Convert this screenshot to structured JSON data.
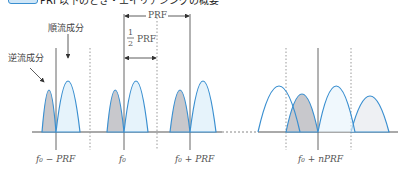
{
  "header": {
    "title_partial": "PRF以下のとき・エイリアシングの概要"
  },
  "annotations": {
    "reverse_flow": "逆流成分",
    "forward_flow": "順流成分",
    "prf": "PRF",
    "half_prf_num": "1",
    "half_prf_den": "2",
    "half_prf_unit": "PRF"
  },
  "axis_labels": {
    "f0_minus_prf": "f₀ − PRF",
    "f0": "f₀",
    "f0_plus_prf": "f₀ + PRF",
    "f0_plus_nprf": "f₀ + nPRF"
  },
  "colors": {
    "curve": "#3a8fd0",
    "forward_fill": "#e6f3fb",
    "reverse_fill": "#c8c8cc",
    "axis": "#555555",
    "dotted": "#888888"
  }
}
